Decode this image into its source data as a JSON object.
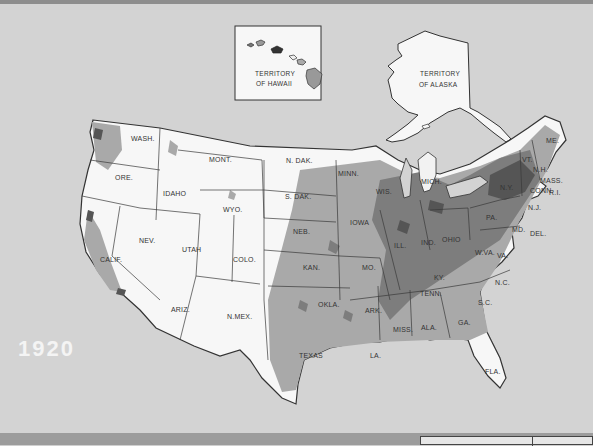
{
  "map": {
    "year": "1920",
    "insets": {
      "hawaii": {
        "line1": "TERRITORY",
        "line2": "OF HAWAII"
      },
      "alaska": {
        "line1": "TERRITORY",
        "line2": "OF ALASKA"
      }
    },
    "state_labels": {
      "wash": "WASH.",
      "ore": "ORE.",
      "calif": "CALIF.",
      "idaho": "IDAHO",
      "nev": "NEV.",
      "mont": "MONT.",
      "wyo": "WYO.",
      "utah": "UTAH",
      "ariz": "ARIZ.",
      "colo": "COLO.",
      "nmex": "N.MEX.",
      "ndak": "N. DAK.",
      "sdak": "S. DAK.",
      "neb": "NEB.",
      "kan": "KAN.",
      "okla": "OKLA.",
      "texas": "TEXAS",
      "minn": "MINN.",
      "iowa": "IOWA",
      "mo": "MO.",
      "ark": "ARK.",
      "la": "LA.",
      "wis": "WIS.",
      "ill": "ILL.",
      "mich": "MICH.",
      "ind": "IND.",
      "ohio": "OHIO",
      "ky": "KY.",
      "tenn": "TENN.",
      "miss": "MISS.",
      "ala": "ALA.",
      "ga": "GA.",
      "fla": "FLA.",
      "sc": "S.C.",
      "nc": "N.C.",
      "va": "VA.",
      "wva": "W.VA.",
      "pa": "PA.",
      "ny": "N.Y.",
      "vt": "VT.",
      "nh": "N.H.",
      "me": "ME.",
      "mass": "MASS.",
      "ri": "R.I.",
      "conn": "CONN.",
      "nj": "N.J.",
      "del": "DEL.",
      "md": "MD."
    },
    "colors": {
      "background": "#d3d3d3",
      "land_sparse": "#f7f7f7",
      "density_low": "#a9a9a9",
      "density_mid": "#7d7d7d",
      "density_high": "#555555",
      "border": "#3a3a3a",
      "year_text": "#f4f4f4"
    }
  }
}
